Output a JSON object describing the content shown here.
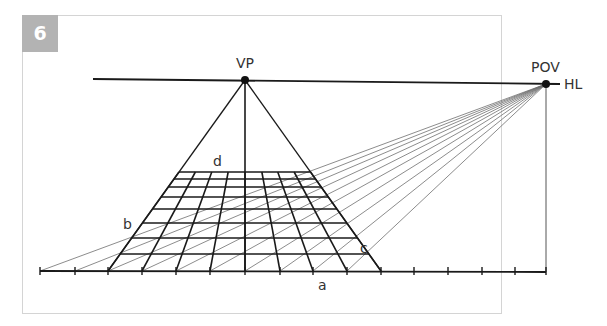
{
  "figure": {
    "number": "6",
    "labels": {
      "vp": "VP",
      "pov": "POV",
      "hl": "HL",
      "a": "a",
      "b": "b",
      "c": "c",
      "d": "d"
    },
    "colors": {
      "badge": "#b3b3b3",
      "frame": "#d4d4d4",
      "ink": "#1a1a1a",
      "construction": "#6e6e6e"
    }
  }
}
